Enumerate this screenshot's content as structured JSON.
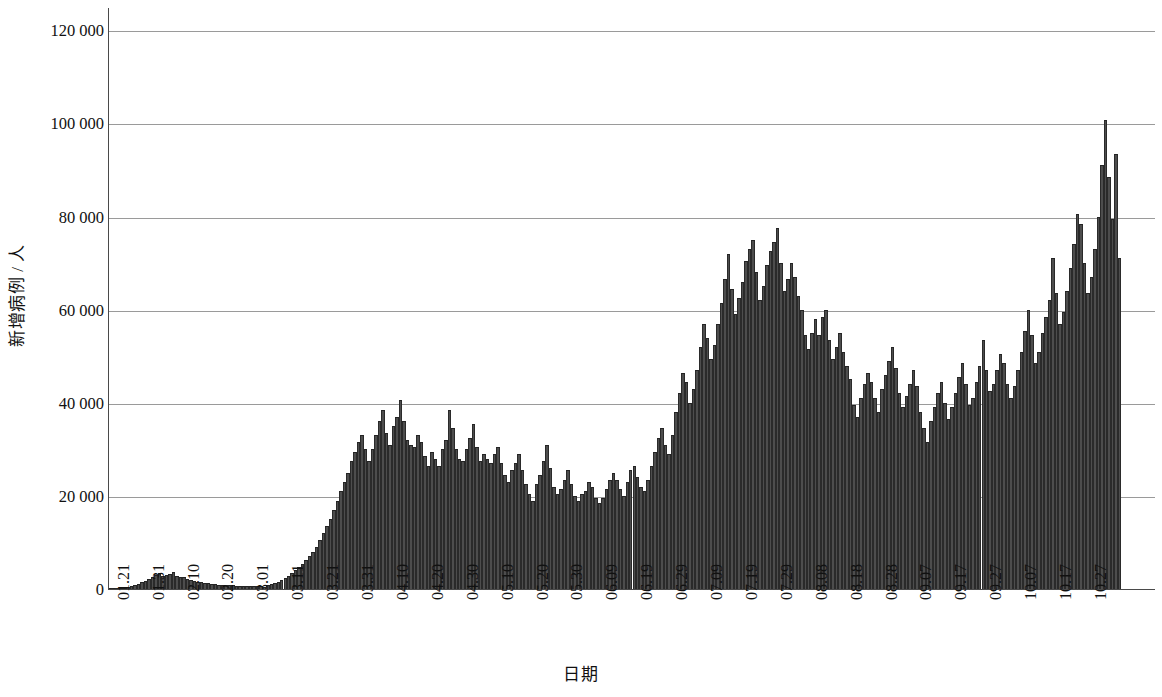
{
  "chart_data": {
    "type": "bar",
    "title": "",
    "xlabel": "日期",
    "ylabel": "新增病例 / 人",
    "ylim": [
      0,
      125000
    ],
    "grid": true,
    "legend": null,
    "y_ticks": [
      0,
      20000,
      40000,
      60000,
      80000,
      100000,
      120000
    ],
    "y_tick_labels": [
      "0",
      "20 000",
      "40 000",
      "60 000",
      "80 000",
      "100 000",
      "120 000"
    ],
    "x_tick_labels": [
      "01.21",
      "01.31",
      "02.10",
      "02.20",
      "03.01",
      "03.11",
      "03.21",
      "03.31",
      "04.10",
      "04.20",
      "04.30",
      "05.10",
      "05.20",
      "05.30",
      "06.09",
      "06.19",
      "06.29",
      "07.09",
      "07.19",
      "07.29",
      "08.08",
      "08.18",
      "08.28",
      "09.07",
      "09.17",
      "09.27",
      "10.07",
      "10.17",
      "10.27"
    ],
    "x_tick_indices": [
      0,
      10,
      20,
      30,
      40,
      50,
      60,
      70,
      80,
      90,
      100,
      110,
      120,
      130,
      140,
      150,
      160,
      170,
      180,
      190,
      200,
      210,
      220,
      230,
      240,
      250,
      260,
      270,
      280
    ],
    "bar_color": "#4d4d4d",
    "bar_edge_color": "#2a2a2a",
    "n_points": 286,
    "x_start": "01.21",
    "x_end": "11.01",
    "values": [
      60,
      80,
      110,
      160,
      250,
      420,
      620,
      800,
      1000,
      1400,
      1800,
      2100,
      2600,
      3000,
      3400,
      2800,
      3100,
      3300,
      3700,
      2900,
      2600,
      2500,
      2200,
      2000,
      1800,
      1600,
      1500,
      1300,
      1200,
      1100,
      1000,
      950,
      900,
      860,
      820,
      780,
      740,
      700,
      680,
      650,
      620,
      600,
      580,
      560,
      540,
      900,
      1100,
      1300,
      1600,
      1900,
      2300,
      2800,
      3400,
      4000,
      4700,
      5400,
      6200,
      7100,
      8000,
      9000,
      10500,
      12000,
      13500,
      15000,
      17000,
      19000,
      21000,
      23000,
      25000,
      27500,
      29500,
      31500,
      33000,
      30000,
      27500,
      30000,
      33000,
      36000,
      38500,
      33500,
      31000,
      35000,
      37000,
      40500,
      36000,
      32000,
      31000,
      30500,
      33000,
      31500,
      28500,
      26500,
      29500,
      28000,
      26500,
      30000,
      32000,
      38500,
      34500,
      30000,
      28000,
      27500,
      30000,
      32500,
      35500,
      30500,
      27500,
      29000,
      28000,
      27000,
      29000,
      30500,
      27000,
      24500,
      23000,
      25500,
      27000,
      29000,
      25500,
      22500,
      20500,
      19000,
      22500,
      24500,
      27500,
      31000,
      26000,
      22000,
      20500,
      21500,
      23500,
      25500,
      22500,
      20000,
      19000,
      20500,
      21000,
      23000,
      22000,
      19500,
      18500,
      19500,
      21500,
      23500,
      25000,
      23500,
      21500,
      20000,
      23000,
      25500,
      26500,
      24000,
      22000,
      21000,
      23500,
      26500,
      29500,
      32500,
      34500,
      31000,
      29000,
      33000,
      38000,
      42000,
      46500,
      44500,
      40000,
      43000,
      47000,
      52000,
      57000,
      54000,
      49500,
      52500,
      57000,
      61500,
      66500,
      72000,
      64500,
      59000,
      62500,
      66000,
      70500,
      73000,
      75000,
      68000,
      62000,
      65000,
      69500,
      72500,
      74500,
      77500,
      70000,
      64000,
      66500,
      70000,
      67000,
      63000,
      60000,
      54500,
      51500,
      55000,
      58000,
      54500,
      58500,
      60000,
      53500,
      49500,
      52000,
      55000,
      51000,
      48000,
      45000,
      39500,
      37000,
      41000,
      44000,
      46500,
      44500,
      41000,
      38000,
      43000,
      46000,
      49000,
      52000,
      47500,
      42000,
      39000,
      41500,
      44000,
      47000,
      43500,
      38000,
      34500,
      31500,
      36000,
      39000,
      42000,
      44500,
      40000,
      36500,
      39000,
      42000,
      45500,
      48500,
      44000,
      39500,
      41000,
      44500,
      48000,
      53500,
      47000,
      42500,
      44000,
      47000,
      50500,
      48500,
      44000,
      41000,
      43500,
      47000,
      51000,
      55500,
      60000,
      54500,
      48500,
      51000,
      55000,
      58500,
      62000,
      71000,
      63500,
      57000,
      59500,
      64000,
      69000,
      74000,
      80500,
      78500,
      70000,
      63500,
      67000,
      73000,
      80000,
      91000,
      100800,
      88500,
      79500,
      93500,
      71000
    ]
  }
}
